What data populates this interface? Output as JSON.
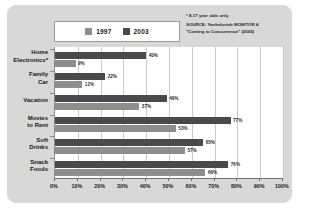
{
  "legend": {
    "entries": [
      {
        "label": "1997",
        "color": "#8e8e8c"
      },
      {
        "label": "2003",
        "color": "#4a4a4c"
      }
    ]
  },
  "notes": {
    "footnote": "* 8-17 year olds only",
    "source_line1": "SOURCE: Yankelovich MONITOR &",
    "source_line2": "\"Coming to Concurrence\" (2005)"
  },
  "chart_data": {
    "type": "bar",
    "orientation": "horizontal",
    "title": "",
    "xlabel": "",
    "ylabel": "",
    "xlim": [
      0,
      100
    ],
    "grid": true,
    "legend_position": "top",
    "categories": [
      "Home Electronics*",
      "Family Car",
      "Vacation",
      "Movies to Rent",
      "Soft Drinks",
      "Snack Foods"
    ],
    "category_lines": [
      [
        "Home",
        "Electronics*"
      ],
      [
        "Family",
        "Car"
      ],
      [
        "Vacation"
      ],
      [
        "Movies",
        "to Rent"
      ],
      [
        "Soft",
        "Drinks"
      ],
      [
        "Snack",
        "Foods"
      ]
    ],
    "series": [
      {
        "name": "2003",
        "color": "#4a4a4c",
        "values": [
          40,
          22,
          49,
          77,
          65,
          76
        ]
      },
      {
        "name": "1997",
        "color": "#8e8e8c",
        "values": [
          9,
          12,
          37,
          53,
          57,
          66
        ]
      }
    ],
    "value_labels": {
      "2003": [
        "40%",
        "22%",
        "49%",
        "77%",
        "65%",
        "76%"
      ],
      "1997": [
        "9%",
        "12%",
        "37%",
        "53%",
        "57%",
        "66%"
      ]
    },
    "xticks": [
      0,
      10,
      20,
      30,
      40,
      50,
      60,
      70,
      80,
      90,
      100
    ],
    "xtick_labels": [
      "0%",
      "10%",
      "20%",
      "30%",
      "40%",
      "50%",
      "60%",
      "70%",
      "80%",
      "90%",
      "100%"
    ]
  },
  "colors": {
    "panel_background": "#d8d8d6",
    "plot_background": "#ffffff",
    "gridline": "#c9c9c7",
    "axis": "#6e6e6c",
    "text": "#15151a"
  }
}
